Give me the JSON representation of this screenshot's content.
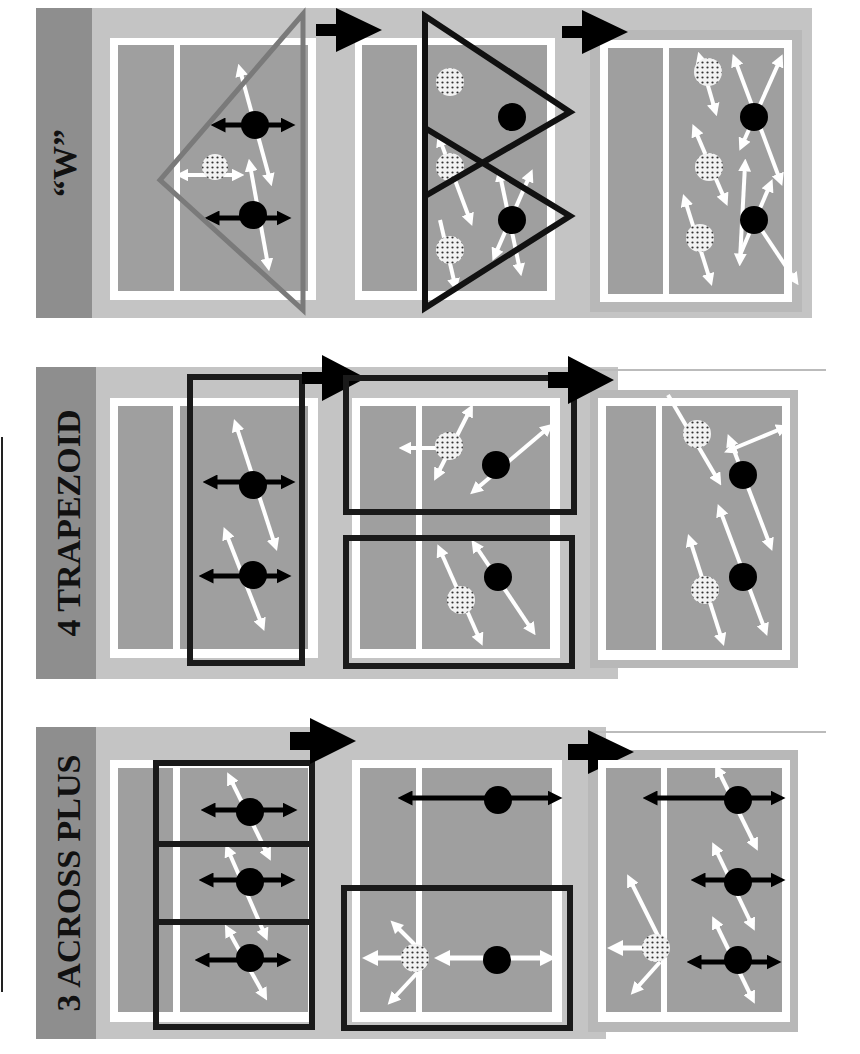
{
  "diagram": {
    "colors": {
      "background": "#ffffff",
      "label_band": "#8e8e8e",
      "outer_court": "#c4c4c4",
      "court_fill": "#9f9f9f",
      "court_lines": "#ffffff",
      "player_front": "#000000",
      "player_back": "#dcdcdc",
      "grey_triangle": "#7a7a7a",
      "group_box": "#1a1a1a"
    },
    "rows": [
      {
        "label": "“W”",
        "grouping_shape": "triangle",
        "panels": 3
      },
      {
        "label": "4 TRAPEZOID",
        "grouping_shape": "rectangle",
        "panels": 3
      },
      {
        "label": "3 ACROSS PLUS",
        "grouping_shape": "rectangle",
        "panels": 3
      }
    ],
    "legend": {
      "solid_circle": "front-row / setter side player",
      "dotted_circle": "back-row passer",
      "black_arrow": "lateral movement",
      "white_arrow": "passing coverage movement",
      "big_arrow": "progression to next step"
    }
  }
}
